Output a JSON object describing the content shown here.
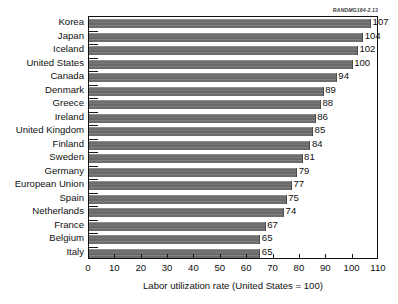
{
  "source_label": "RANDMG164-2.13",
  "chart_data": {
    "type": "bar",
    "orientation": "horizontal",
    "title": "",
    "subtitle": "",
    "xlabel": "Labor utilization rate (United States = 100)",
    "ylabel": "",
    "xlim": [
      0,
      110
    ],
    "xticks": [
      0,
      10,
      20,
      30,
      40,
      50,
      60,
      70,
      80,
      90,
      100,
      110
    ],
    "xtick_labels": [
      "0",
      "10",
      "20",
      "30",
      "40",
      "50",
      "60",
      "70",
      "80",
      "90",
      "100",
      "110"
    ],
    "grid": false,
    "legend": "none",
    "bar_color": "#6e6e6e",
    "frame_color": "#111111",
    "categories": [
      "Korea",
      "Japan",
      "Iceland",
      "United States",
      "Canada",
      "Denmark",
      "Greece",
      "Ireland",
      "United Kingdom",
      "Finland",
      "Sweden",
      "Germany",
      "European Union",
      "Spain",
      "Netherlands",
      "France",
      "Belgium",
      "Italy"
    ],
    "values": [
      107,
      104,
      102,
      100,
      94,
      89,
      88,
      86,
      85,
      84,
      81,
      79,
      77,
      75,
      74,
      67,
      65,
      65
    ],
    "value_labels": [
      "107",
      "104",
      "102",
      "100",
      "94",
      "89",
      "88",
      "86",
      "85",
      "84",
      "81",
      "79",
      "77",
      "75",
      "74",
      "67",
      "65",
      "65"
    ]
  }
}
